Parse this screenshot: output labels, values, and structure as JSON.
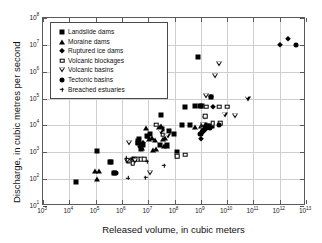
{
  "chart_data": {
    "type": "scatter",
    "title": "",
    "xlabel": "Released volume, in cubic meters",
    "ylabel": "Discharge, in cubic metres per second",
    "xscale": "log",
    "yscale": "log",
    "xlim": [
      1000,
      10000000000000
    ],
    "ylim": [
      10,
      100000000
    ],
    "grid": true,
    "legend_position": "upper left",
    "xticks": [
      {
        "label_base": "10",
        "label_exp": "3",
        "value": 1000
      },
      {
        "label_base": "10",
        "label_exp": "4",
        "value": 10000
      },
      {
        "label_base": "10",
        "label_exp": "5",
        "value": 100000
      },
      {
        "label_base": "10",
        "label_exp": "6",
        "value": 1000000
      },
      {
        "label_base": "10",
        "label_exp": "7",
        "value": 10000000
      },
      {
        "label_base": "10",
        "label_exp": "8",
        "value": 100000000
      },
      {
        "label_base": "10",
        "label_exp": "9",
        "value": 1000000000
      },
      {
        "label_base": "10",
        "label_exp": "10",
        "value": 10000000000
      },
      {
        "label_base": "10",
        "label_exp": "11",
        "value": 100000000000
      },
      {
        "label_base": "10",
        "label_exp": "12",
        "value": 1000000000000
      },
      {
        "label_base": "10",
        "label_exp": "13",
        "value": 10000000000000
      }
    ],
    "yticks": [
      {
        "label_base": "10",
        "label_exp": "1",
        "value": 10
      },
      {
        "label_base": "10",
        "label_exp": "2",
        "value": 100
      },
      {
        "label_base": "10",
        "label_exp": "3",
        "value": 1000
      },
      {
        "label_base": "10",
        "label_exp": "4",
        "value": 10000
      },
      {
        "label_base": "10",
        "label_exp": "5",
        "value": 100000
      },
      {
        "label_base": "10",
        "label_exp": "6",
        "value": 1000000
      },
      {
        "label_base": "10",
        "label_exp": "7",
        "value": 10000000
      },
      {
        "label_base": "10",
        "label_exp": "8",
        "value": 100000000
      }
    ],
    "series": [
      {
        "name": "Landslide dams",
        "marker": "filled-square",
        "color": "#000000",
        "points": [
          [
            18000,
            80
          ],
          [
            110000,
            1100
          ],
          [
            350000,
            420
          ],
          [
            400000,
            450
          ],
          [
            500000,
            170
          ],
          [
            1900000,
            480
          ],
          [
            2400000,
            520
          ],
          [
            3000000,
            560
          ],
          [
            4000000,
            2600
          ],
          [
            4200000,
            2300
          ],
          [
            4500000,
            3000
          ],
          [
            5500000,
            1300
          ],
          [
            6200000,
            1800
          ],
          [
            9000000,
            4000
          ],
          [
            12000000,
            5000
          ],
          [
            30000000,
            24000
          ],
          [
            33000000,
            7500
          ],
          [
            28000000,
            1900
          ],
          [
            50000000,
            1900
          ],
          [
            60000000,
            6000
          ],
          [
            95000000,
            5000
          ],
          [
            120000000,
            1000
          ],
          [
            250000000,
            50000
          ],
          [
            600000000,
            55000
          ],
          [
            800000000,
            3400000
          ],
          [
            900000000,
            55000
          ],
          [
            1100000000,
            55000
          ],
          [
            1500000000,
            10000
          ],
          [
            1800000000,
            9000
          ],
          [
            2500000000,
            110000
          ],
          [
            2700000000,
            9500
          ],
          [
            2000000000,
            8500
          ],
          [
            1700000000,
            9800
          ],
          [
            200000000,
            10000
          ],
          [
            400000000,
            10000
          ]
        ]
      },
      {
        "name": "Moraine dams",
        "marker": "filled-triangle",
        "color": "#000000",
        "points": [
          [
            95000,
            200
          ],
          [
            130000,
            200
          ],
          [
            110000,
            105
          ],
          [
            4000000,
            2500
          ],
          [
            5000000,
            2200
          ],
          [
            6000000,
            1500
          ],
          [
            8000000,
            8000
          ],
          [
            9500000,
            4000
          ],
          [
            11000000,
            3000
          ],
          [
            14000000,
            3300
          ],
          [
            18000000,
            2800
          ],
          [
            25000000,
            9000
          ],
          [
            30000000,
            9200
          ],
          [
            35000000,
            3200
          ],
          [
            40000000,
            1700
          ],
          [
            45000000,
            3500
          ],
          [
            50000000,
            1700
          ],
          [
            20000000,
            1300
          ],
          [
            15000000,
            1200
          ],
          [
            600000000,
            9000
          ],
          [
            1000000000,
            9500
          ]
        ]
      },
      {
        "name": "Ruptured ice dams",
        "marker": "filled-diamond",
        "color": "#000000",
        "points": [
          [
            2500000,
            430
          ],
          [
            5000000,
            1600
          ],
          [
            6500000,
            2300
          ],
          [
            1000000000,
            3000
          ],
          [
            1500000000,
            21000
          ],
          [
            2500000000,
            110000
          ],
          [
            3000000000,
            50000
          ],
          [
            1000000000000,
            9800000
          ],
          [
            2000000000000,
            16000000
          ],
          [
            1800000000,
            9000
          ]
        ]
      },
      {
        "name": "Volcanic blockages",
        "marker": "open-square",
        "color": "#000000",
        "points": [
          [
            1700000,
            480
          ],
          [
            2600000,
            400
          ],
          [
            4000000,
            560
          ],
          [
            5500000,
            560
          ],
          [
            7000000,
            560
          ],
          [
            20000000,
            10500
          ],
          [
            35000000,
            4500
          ],
          [
            120000000,
            700
          ],
          [
            130000000,
            730
          ],
          [
            250000000,
            800
          ],
          [
            1500000000,
            22000
          ],
          [
            1600000000,
            50000
          ],
          [
            2800000000,
            12000
          ],
          [
            5000000000,
            50000
          ],
          [
            5500000000,
            12000
          ],
          [
            10000000000,
            50000
          ],
          [
            1200000000,
            8000
          ]
        ]
      },
      {
        "name": "Volcanic basins",
        "marker": "open-down-triangle",
        "color": "#000000",
        "points": [
          [
            1900000,
            2200
          ],
          [
            1600000,
            480
          ],
          [
            3200000,
            490
          ],
          [
            12000000,
            170
          ],
          [
            30000000,
            5800
          ],
          [
            55000000,
            4000
          ],
          [
            1200000000,
            10000
          ],
          [
            1600000000,
            120000
          ],
          [
            3500000000,
            700000
          ],
          [
            5000000000,
            2000000
          ],
          [
            8000000000,
            25000
          ],
          [
            20000000000,
            22000
          ],
          [
            60000000000,
            100000
          ]
        ]
      },
      {
        "name": "Tectonic basins",
        "marker": "filled-circle",
        "color": "#000000",
        "points": [
          [
            500000,
            175
          ],
          [
            600000,
            165
          ],
          [
            900000000,
            4700
          ],
          [
            1000000000,
            5000
          ],
          [
            1100000000,
            5500
          ],
          [
            1200000000,
            6200
          ],
          [
            1300000000,
            6800
          ],
          [
            1400000000,
            7400
          ],
          [
            1500000000,
            7900
          ],
          [
            1600000000,
            8300
          ],
          [
            1700000000,
            8700
          ],
          [
            1800000000,
            9000
          ],
          [
            2000000000,
            9400
          ],
          [
            2300000000,
            7800
          ],
          [
            5000000000,
            10000
          ],
          [
            4000000000000,
            9800000
          ]
        ]
      },
      {
        "name": "Breached estuaries",
        "marker": "plus",
        "color": "#000000",
        "points": [
          [
            1700000,
            110
          ],
          [
            8000000,
            115
          ],
          [
            9000000,
            450
          ],
          [
            40000000,
            320
          ],
          [
            1500000,
            600
          ]
        ]
      }
    ]
  }
}
